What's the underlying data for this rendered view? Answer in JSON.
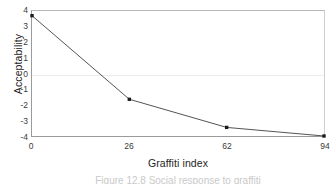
{
  "figure": {
    "caption": "Figure 12.8  Social response to graffiti"
  },
  "chart_data": {
    "type": "line",
    "title": "",
    "xlabel": "Graffiti index",
    "ylabel": "Acceptability",
    "x_scale": "categorical",
    "categories": [
      "0",
      "26",
      "62",
      "94"
    ],
    "x": [
      0,
      26,
      62,
      94
    ],
    "values": [
      3.7,
      -1.65,
      -3.45,
      -4.0
    ],
    "series": [
      {
        "name": "Acceptability",
        "values": [
          3.7,
          -1.65,
          -3.45,
          -4.0
        ]
      }
    ],
    "ylim": [
      -4,
      4
    ],
    "yticks": [
      4,
      3,
      2,
      1,
      0,
      -1,
      -2,
      -3,
      -4
    ],
    "ytick_labels": [
      "4",
      "3",
      "2",
      "1",
      "0",
      "-1",
      "-2",
      "-3",
      "-4"
    ],
    "xtick_labels": [
      "0",
      "26",
      "62",
      "94"
    ],
    "grid": "horizontal-zero-only",
    "legend": "none",
    "marker": "filled-square",
    "line_color": "#545454",
    "marker_color": "#1a1a1a",
    "gridline_color": "#ececec",
    "axis_color": "#9a9a9a",
    "plot_background": "#ffffff"
  }
}
